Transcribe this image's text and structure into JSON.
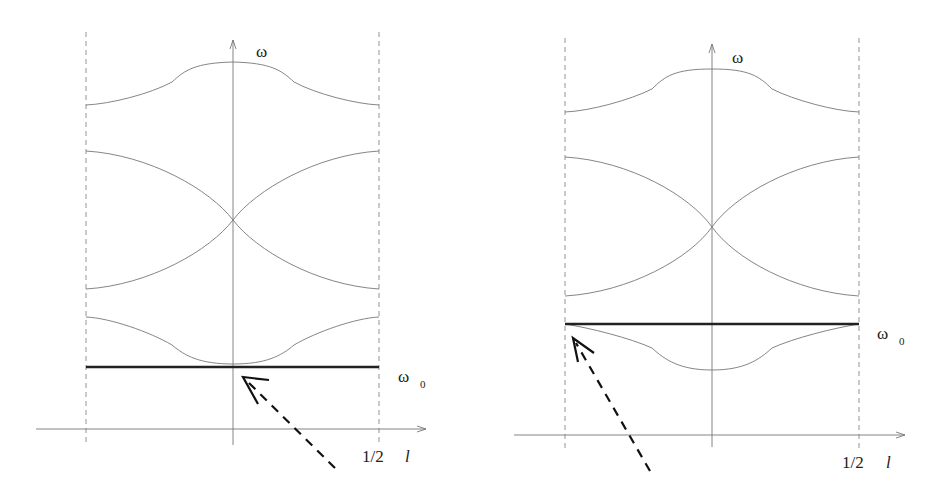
{
  "panels": [
    {
      "id": "left",
      "y_axis_label": "ω",
      "x_axis_label": "l",
      "x_tick_label": "1/2",
      "reference_line_label": "ω",
      "reference_line_subscript": "0",
      "reference_line_position": "below all bands, touching lowest band minimum at l=0",
      "arrow_target": "center (l=0)"
    },
    {
      "id": "right",
      "y_axis_label": "ω",
      "x_axis_label": "l",
      "x_tick_label": "1/2",
      "reference_line_label": "ω",
      "reference_line_subscript": "0",
      "reference_line_position": "inside gap, touching lowest band maximum at zone edge",
      "arrow_target": "zone edge (l=-1/2)"
    }
  ],
  "colors": {
    "band_line": "#777777",
    "reference_line": "#222222",
    "arrow": "#111111",
    "background": "#ffffff"
  }
}
